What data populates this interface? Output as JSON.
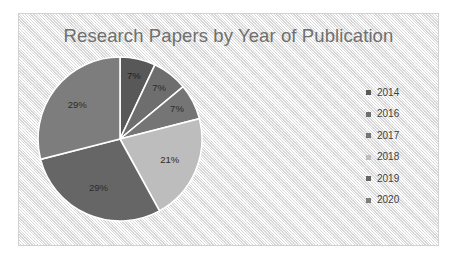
{
  "chart_data": {
    "type": "pie",
    "title": "Research Papers by Year of Publication",
    "categories": [
      "2014",
      "2016",
      "2017",
      "2018",
      "2019",
      "2020"
    ],
    "values": [
      7,
      7,
      7,
      21,
      29,
      29
    ],
    "value_labels": [
      "7%",
      "7%",
      "7%",
      "21%",
      "29%",
      "29%"
    ],
    "unit": "%",
    "start_angle_deg": 0,
    "direction": "clockwise",
    "legend_position": "right",
    "grid": false,
    "xlabel": "",
    "ylabel": "",
    "colors": [
      "#585858",
      "#6e6e6e",
      "#757575",
      "#bdbdbd",
      "#666666",
      "#7d7d7d"
    ],
    "slice_border_color": "#ffffff",
    "label_color": "#2b2b2b",
    "title_color": "#6f6f6f",
    "plot_background": "#f2f2f2",
    "frame_border_color": "#d2d2d2",
    "slices": [
      {
        "label": "2014",
        "value": 7,
        "display": "7%",
        "color": "#585858"
      },
      {
        "label": "2016",
        "value": 7,
        "display": "7%",
        "color": "#6e6e6e"
      },
      {
        "label": "2017",
        "value": 7,
        "display": "7%",
        "color": "#757575"
      },
      {
        "label": "2018",
        "value": 21,
        "display": "21%",
        "color": "#bdbdbd"
      },
      {
        "label": "2019",
        "value": 29,
        "display": "29%",
        "color": "#666666"
      },
      {
        "label": "2020",
        "value": 29,
        "display": "29%",
        "color": "#7d7d7d"
      }
    ]
  }
}
